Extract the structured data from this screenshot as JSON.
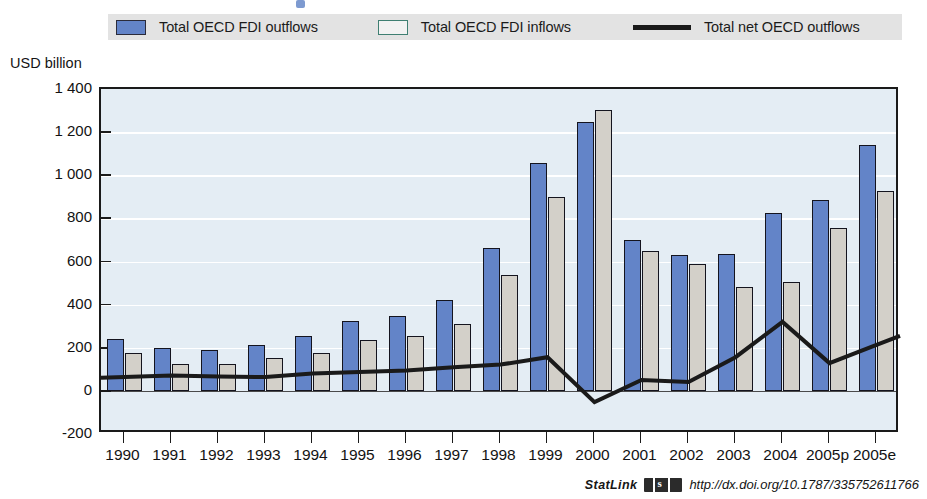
{
  "legend": {
    "items": [
      {
        "label": "Total OECD FDI outflows",
        "marker": "filled-square",
        "color": "#6384c8"
      },
      {
        "label": "Total OECD FDI inflows",
        "marker": "open-square",
        "color": "#f2f2f2"
      },
      {
        "label": "Total net OECD outflows",
        "marker": "line",
        "color": "#1a1a1a"
      }
    ]
  },
  "axis_title": "USD billion",
  "statlink": {
    "word": "StatLink",
    "icon": "statlink-barcode-icon",
    "url": "http://dx.doi.org/10.1787/335752611766"
  },
  "chart_data": {
    "type": "bar",
    "title": "",
    "subtitle": "",
    "xlabel": "",
    "ylabel": "USD billion",
    "ylim": [
      -200,
      1400
    ],
    "yticks": [
      -200,
      0,
      200,
      400,
      600,
      800,
      1000,
      1200,
      1400
    ],
    "ytick_labels": [
      "-200",
      "0",
      "200",
      "400",
      "600",
      "800",
      "1 000",
      "1 200",
      "1 400"
    ],
    "grid": true,
    "legend_position": "top",
    "categories": [
      "1990",
      "1991",
      "1992",
      "1993",
      "1994",
      "1995",
      "1996",
      "1997",
      "1998",
      "1999",
      "2000",
      "2001",
      "2002",
      "2003",
      "2004",
      "2005p",
      "2005e"
    ],
    "series": [
      {
        "name": "Total OECD FDI outflows",
        "type": "bar",
        "color": "#6384c8",
        "values": [
          240,
          197,
          190,
          215,
          255,
          322,
          349,
          420,
          661,
          1057,
          1249,
          700,
          629,
          637,
          823,
          886,
          1138
        ]
      },
      {
        "name": "Total OECD FDI inflows",
        "type": "bar",
        "color": "#d3d0c9",
        "values": [
          176,
          126,
          124,
          151,
          174,
          234,
          255,
          310,
          539,
          901,
          1301,
          649,
          588,
          481,
          503,
          757,
          925
        ]
      },
      {
        "name": "Total net OECD outflows",
        "type": "line",
        "color": "#1a1a1a",
        "values": [
          64,
          71,
          66,
          64,
          81,
          88,
          94,
          110,
          122,
          156,
          -52,
          51,
          41,
          156,
          320,
          129,
          213
        ]
      }
    ]
  }
}
